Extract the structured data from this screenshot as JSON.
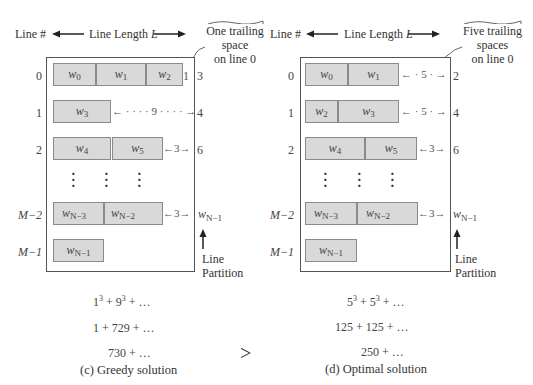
{
  "header": {
    "line_number_label": "Line #",
    "line_length_label": "Line Length",
    "line_length_var": "L"
  },
  "left_panel": {
    "callout": [
      "One trailing",
      "space",
      "on line 0"
    ],
    "line_numbers": [
      "0",
      "1",
      "2",
      "M−2",
      "M−1"
    ],
    "rows": [
      {
        "words": [
          {
            "w": "w",
            "sub": "0"
          },
          {
            "w": "w",
            "sub": "1"
          },
          {
            "w": "w",
            "sub": "2"
          }
        ],
        "gap": "1",
        "cumulative": "3"
      },
      {
        "words": [
          {
            "w": "w",
            "sub": "3"
          }
        ],
        "gap": "← · · · · 9 · · · · →",
        "cumulative": "4"
      },
      {
        "words": [
          {
            "w": "w",
            "sub": "4"
          },
          {
            "w": "w",
            "sub": "5"
          }
        ],
        "gap": "←3→",
        "cumulative": "6"
      },
      {
        "words": [
          {
            "w": "w",
            "sub": "N−3"
          },
          {
            "w": "w",
            "sub": "N−2"
          }
        ],
        "gap": "←3→",
        "cumulative": "w",
        "cumulative_sub": "N−1"
      },
      {
        "words": [
          {
            "w": "w",
            "sub": "N−1"
          }
        ],
        "gap": "",
        "cumulative": ""
      }
    ],
    "partition_label": [
      "Line",
      "Partition"
    ],
    "equations": [
      "1³ + 9³ + …",
      "1 + 729 + …",
      "730 + …"
    ],
    "caption": "(c) Greedy solution"
  },
  "right_panel": {
    "callout": [
      "Five trailing",
      "spaces",
      "on line 0"
    ],
    "line_numbers": [
      "0",
      "1",
      "2",
      "M−2",
      "M−1"
    ],
    "rows": [
      {
        "words": [
          {
            "w": "w",
            "sub": "0"
          },
          {
            "w": "w",
            "sub": "1"
          }
        ],
        "gap": "← · 5 · →",
        "cumulative": "2"
      },
      {
        "words": [
          {
            "w": "w",
            "sub": "2"
          },
          {
            "w": "w",
            "sub": "3"
          }
        ],
        "gap": "← · 5 · →",
        "cumulative": "4"
      },
      {
        "words": [
          {
            "w": "w",
            "sub": "4"
          },
          {
            "w": "w",
            "sub": "5"
          }
        ],
        "gap": "←3→",
        "cumulative": "6"
      },
      {
        "words": [
          {
            "w": "w",
            "sub": "N−3"
          },
          {
            "w": "w",
            "sub": "N−2"
          }
        ],
        "gap": "←3→",
        "cumulative": "w",
        "cumulative_sub": "N−1"
      },
      {
        "words": [
          {
            "w": "w",
            "sub": "N−1"
          }
        ],
        "gap": "",
        "cumulative": ""
      }
    ],
    "partition_label": [
      "Line",
      "Partition"
    ],
    "equations": [
      "5³ + 5³ + …",
      "125 + 125 + …",
      "250 + …"
    ],
    "caption": "(d) Optimal solution"
  },
  "comparison_symbol": ">",
  "colors": {
    "word_fill": "#d9d9d9",
    "word_border": "#8a8a8a",
    "frame": "#555555",
    "text": "#333333"
  }
}
